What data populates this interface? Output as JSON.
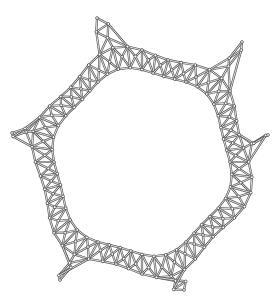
{
  "figure": {
    "kind": "hexagonal ring framework line drawing",
    "width": 279,
    "height": 306,
    "colors": {
      "background": "#ffffff",
      "line": "#555555"
    },
    "ring": {
      "center": [
        142,
        162
      ],
      "radius_outer": 124,
      "radius_inner": 88,
      "arms": 6
    },
    "arm_tips": [
      [
        97,
        18
      ],
      [
        242,
        42
      ],
      [
        12,
        133
      ],
      [
        268,
        135
      ],
      [
        60,
        280
      ],
      [
        184,
        290
      ]
    ]
  }
}
